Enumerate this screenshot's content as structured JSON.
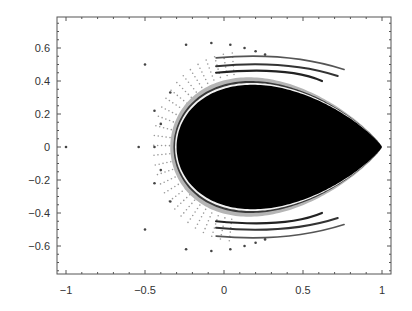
{
  "chart_data": {
    "type": "scatter",
    "title": "",
    "xlabel": "",
    "ylabel": "",
    "xlim": [
      -1.05,
      1.05
    ],
    "ylim": [
      -0.77,
      0.78
    ],
    "grid": false,
    "legend": null,
    "x_ticks": [
      -1,
      -0.5,
      0,
      0.5,
      1
    ],
    "x_tick_labels": [
      "−1",
      "−0.5",
      "0",
      "0.5",
      "1"
    ],
    "y_ticks": [
      0.6,
      0.4,
      0.2,
      0,
      -0.2,
      -0.4,
      -0.6
    ],
    "y_tick_labels": [
      "0.6",
      "0.4",
      "0.2",
      "0",
      "−0.2",
      "−0.4",
      "−0.6"
    ],
    "filled_region": {
      "left_x": -0.3,
      "tip": [
        1.0,
        0.0
      ],
      "max_abs_y": 0.41,
      "color": "#000000"
    },
    "outer_arcs": [
      {
        "name": "inner arc",
        "end": [
          0.62,
          0.4
        ]
      },
      {
        "name": "middle arc",
        "end": [
          0.72,
          0.43
        ]
      },
      {
        "name": "outer arc",
        "end": [
          0.76,
          0.47
        ]
      }
    ],
    "isolated_points": [
      [
        -1.0,
        0.0
      ],
      [
        -0.54,
        0.0
      ],
      [
        -0.44,
        0.0
      ],
      [
        -0.5,
        0.5
      ],
      [
        -0.5,
        -0.5
      ],
      [
        -0.44,
        0.22
      ],
      [
        -0.44,
        -0.22
      ],
      [
        -0.4,
        0.14
      ],
      [
        -0.4,
        -0.14
      ],
      [
        -0.34,
        0.33
      ],
      [
        -0.34,
        -0.33
      ],
      [
        -0.24,
        0.62
      ],
      [
        -0.24,
        -0.62
      ],
      [
        -0.08,
        0.63
      ],
      [
        -0.08,
        -0.63
      ],
      [
        0.04,
        0.62
      ],
      [
        0.04,
        -0.62
      ],
      [
        0.13,
        0.6
      ],
      [
        0.13,
        -0.6
      ],
      [
        0.2,
        0.58
      ],
      [
        0.2,
        -0.58
      ],
      [
        0.26,
        0.56
      ],
      [
        0.26,
        -0.56
      ]
    ]
  }
}
